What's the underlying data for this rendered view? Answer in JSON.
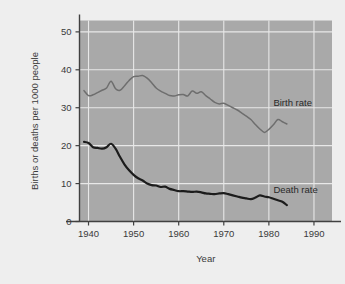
{
  "chart_data": {
    "type": "line",
    "title": "",
    "subtitle": "",
    "xlabel": "Year",
    "ylabel": "Births or deaths per 1000 people",
    "xlim": [
      1938,
      1994
    ],
    "ylim": [
      0,
      53
    ],
    "xticks": [
      1940,
      1950,
      1960,
      1970,
      1980,
      1990
    ],
    "xtick_labels": [
      "1940",
      "1950",
      "1960",
      "1970",
      "1980",
      "1990"
    ],
    "yticks": [
      0,
      10,
      20,
      30,
      40,
      50
    ],
    "ytick_labels": [
      "0",
      "10",
      "20",
      "30",
      "40",
      "50"
    ],
    "grid": true,
    "grid_color": "#e8e8e8",
    "plot_background": "#a9a9a9",
    "figure_background": "#eeeeee",
    "legend_position": "inline-annotation",
    "annotations": [
      {
        "text": "Birth rate",
        "x": 1981,
        "y": 30.4
      },
      {
        "text": "Death rate",
        "x": 1981,
        "y": 7.6
      }
    ],
    "series": [
      {
        "name": "Birth rate",
        "color": "#6e6e6e",
        "line_width": 1.5,
        "x": [
          1939,
          1940,
          1941,
          1942,
          1943,
          1944,
          1945,
          1946,
          1947,
          1948,
          1949,
          1950,
          1951,
          1952,
          1953,
          1954,
          1955,
          1956,
          1957,
          1958,
          1959,
          1960,
          1961,
          1962,
          1963,
          1964,
          1965,
          1966,
          1967,
          1968,
          1969,
          1970,
          1971,
          1972,
          1973,
          1974,
          1975,
          1976,
          1977,
          1978,
          1979,
          1980,
          1981,
          1982,
          1983,
          1984
        ],
        "values": [
          34.5,
          33.2,
          33.4,
          34.0,
          34.6,
          35.2,
          37.0,
          35.0,
          34.6,
          35.8,
          37.2,
          38.2,
          38.3,
          38.5,
          37.8,
          36.6,
          35.2,
          34.4,
          33.8,
          33.2,
          33.1,
          33.4,
          33.5,
          33.1,
          34.4,
          33.8,
          34.2,
          33.2,
          32.3,
          31.4,
          31.0,
          31.2,
          30.6,
          30.0,
          29.4,
          28.6,
          27.8,
          26.9,
          25.6,
          24.4,
          23.5,
          24.3,
          25.5,
          26.9,
          26.3,
          25.7
        ]
      },
      {
        "name": "Death rate",
        "color": "#1c1c1c",
        "line_width": 2.2,
        "x": [
          1939,
          1940,
          1941,
          1942,
          1943,
          1944,
          1945,
          1946,
          1947,
          1948,
          1949,
          1950,
          1951,
          1952,
          1953,
          1954,
          1955,
          1956,
          1957,
          1958,
          1959,
          1960,
          1961,
          1962,
          1963,
          1964,
          1965,
          1966,
          1967,
          1968,
          1969,
          1970,
          1971,
          1972,
          1973,
          1974,
          1975,
          1976,
          1977,
          1978,
          1979,
          1980,
          1981,
          1982,
          1983,
          1984
        ],
        "values": [
          21.0,
          20.7,
          19.6,
          19.4,
          19.2,
          19.6,
          20.5,
          19.2,
          17.0,
          15.0,
          13.5,
          12.3,
          11.4,
          10.8,
          10.0,
          9.6,
          9.5,
          9.1,
          9.2,
          8.6,
          8.3,
          8.0,
          8.0,
          7.9,
          7.8,
          7.9,
          7.7,
          7.4,
          7.3,
          7.2,
          7.4,
          7.5,
          7.2,
          6.9,
          6.6,
          6.3,
          6.1,
          5.9,
          6.3,
          6.9,
          6.6,
          6.4,
          6.0,
          5.6,
          5.2,
          4.3
        ]
      }
    ]
  }
}
